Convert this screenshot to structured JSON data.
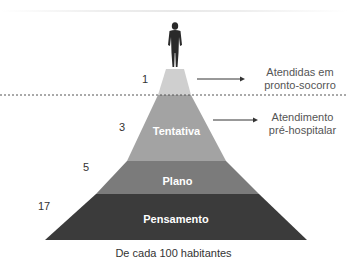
{
  "pyramid": {
    "layers": [
      {
        "name": "tip",
        "label": "",
        "count": "1",
        "color": "#c9c9c9"
      },
      {
        "name": "tentativa",
        "label": "Tentativa",
        "count": "3",
        "color": "#a5a5a5"
      },
      {
        "name": "plano",
        "label": "Plano",
        "count": "5",
        "color": "#7c7c7c"
      },
      {
        "name": "pensamento",
        "label": "Pensamento",
        "count": "17",
        "color": "#3a3a3a"
      }
    ]
  },
  "annotations": {
    "top_line1": "Atendidas em",
    "top_line2": "pronto-socorro",
    "mid_line1": "Atendimento",
    "mid_line2": "pré-hospitalar"
  },
  "caption": "De cada 100 habitantes"
}
